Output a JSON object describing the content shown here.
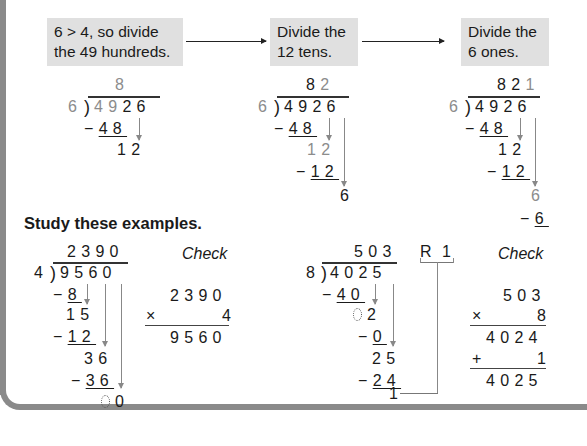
{
  "steps": [
    {
      "label": "6 > 4, so divide the 49 hundreds.",
      "line1": "6 > 4, so divide",
      "line2": "the 49 hundreds."
    },
    {
      "label": "Divide the 12 tens.",
      "line1": "Divide the",
      "line2": "12 tens."
    },
    {
      "label": "Divide the 6 ones.",
      "line1": "Divide the",
      "line2": "6 ones."
    }
  ],
  "worked_example": {
    "divisor": "6",
    "dividend": "4926",
    "step1": {
      "quotient": "8",
      "sub1": "48",
      "rem1": "12"
    },
    "step2": {
      "quotient": "82",
      "sub1": "48",
      "rem1": "12",
      "sub2": "12",
      "rem2": "6"
    },
    "step3": {
      "quotient": "821",
      "sub1": "48",
      "rem1": "12",
      "sub2": "12",
      "rem2": "6",
      "sub3": "6"
    }
  },
  "section_heading": "Study these examples.",
  "example1": {
    "divisor": "4",
    "dividend": "9560",
    "quotient": "2390",
    "steps": [
      "8",
      "15",
      "12",
      "36",
      "36",
      "00"
    ],
    "check": {
      "label": "Check",
      "factor1": "2390",
      "operator": "×",
      "factor2": "4",
      "product": "9560"
    }
  },
  "example2": {
    "divisor": "8",
    "dividend": "4025",
    "quotient": "503",
    "remainder_label": "R 1",
    "steps": [
      "40",
      "02",
      "0",
      "25",
      "24",
      "1"
    ],
    "check": {
      "label": "Check",
      "factor1": "503",
      "mult_operator": "×",
      "factor2": "8",
      "product": "4024",
      "add_operator": "+",
      "addend": "1",
      "sum": "4025"
    }
  }
}
